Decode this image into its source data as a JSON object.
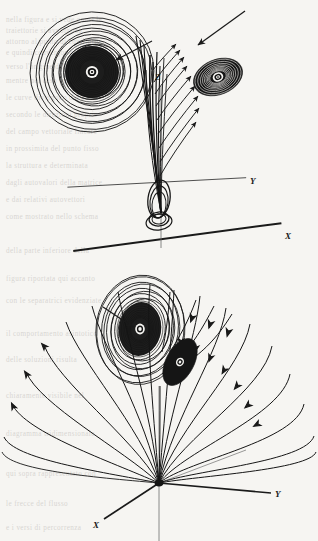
{
  "figure": {
    "background_color": "#f6f5f2",
    "ink_color": "#1a1a1a",
    "panels": [
      {
        "id": "upper-panel",
        "name": "upper-phase-portrait",
        "description": "Spiral focus trajectory winding down a vertical Z axis onto the origin of an X-Y plane",
        "origin": {
          "x": 161,
          "y": 213
        },
        "axes": [
          {
            "name": "x-axis",
            "label": "X",
            "label_x": 285,
            "label_y": 239,
            "stroke_width": 1.9
          },
          {
            "name": "y-axis",
            "label": "Y",
            "label_x": 250,
            "label_y": 184,
            "stroke_width": 0.75
          },
          {
            "name": "z-axis",
            "label": "Z",
            "label_x": 158,
            "label_y": 78,
            "stroke_width": 0.75
          }
        ],
        "features": [
          {
            "name": "large-spiral-focus",
            "center_x": 92,
            "center_y": 72,
            "radius_x": 62,
            "radius_y": 60,
            "turns": 17
          },
          {
            "name": "small-spiral-focus",
            "center_x": 218,
            "center_y": 77,
            "radius_x": 26,
            "radius_y": 18,
            "rotation_deg": -22,
            "turns": 12
          },
          {
            "name": "incoming-arrow",
            "from_x": 243,
            "from_y": 12,
            "to_x": 196,
            "to_y": 46
          },
          {
            "name": "trajectory-bundle",
            "count": 9
          }
        ]
      },
      {
        "id": "lower-panel",
        "name": "lower-phase-portrait",
        "description": "Fan of trajectories emanating from the origin node, feeding a spiral focus above the X-Y plane",
        "origin": {
          "x": 159,
          "y": 483
        },
        "axes": [
          {
            "name": "x-axis",
            "label": "X",
            "label_x": 97,
            "label_y": 525,
            "stroke_width": 1.6
          },
          {
            "name": "y-axis",
            "label": "Y",
            "label_x": 277,
            "label_y": 495,
            "stroke_width": 1.6
          },
          {
            "name": "z-axis",
            "label": "",
            "label_x": 0,
            "label_y": 0,
            "stroke_width": 0.7
          }
        ],
        "features": [
          {
            "name": "large-spiral-focus",
            "center_x": 140,
            "center_y": 329,
            "radius_x": 44,
            "radius_y": 54,
            "turns": 16
          },
          {
            "name": "small-spiral-focus",
            "center_x": 180,
            "center_y": 362,
            "radius_x": 14,
            "radius_y": 26,
            "rotation_deg": 28,
            "turns": 10
          },
          {
            "name": "trajectory-fan-left",
            "count": 8
          },
          {
            "name": "trajectory-fan-right",
            "count": 8
          }
        ]
      }
    ],
    "ghost_text": [
      {
        "text": "nella figura  e  si  vede  come  le",
        "x": 6,
        "y": 16
      },
      {
        "text": "traiettorie  si  avvolgono",
        "x": 6,
        "y": 27
      },
      {
        "text": "attorno  al  punto  di  equilibrio",
        "x": 6,
        "y": 38
      },
      {
        "text": "e  quindi  convergono",
        "x": 6,
        "y": 49
      },
      {
        "text": "verso  l'origine  del  sistema",
        "x": 6,
        "y": 63
      },
      {
        "text": "mentre  nel  caso  opposto",
        "x": 6,
        "y": 77
      },
      {
        "text": "le  curve  divergono  dal  nodo",
        "x": 6,
        "y": 94
      },
      {
        "text": "secondo  le  direzioni  proprie",
        "x": 6,
        "y": 111
      },
      {
        "text": "del  campo  vettoriale  lineare",
        "x": 6,
        "y": 128
      },
      {
        "text": "in  prossimita  del  punto  fisso",
        "x": 6,
        "y": 145
      },
      {
        "text": "la  struttura  e  determinata",
        "x": 6,
        "y": 162
      },
      {
        "text": "dagli  autovalori  della  matrice",
        "x": 6,
        "y": 179
      },
      {
        "text": "e  dai  relativi  autovettori",
        "x": 6,
        "y": 196
      },
      {
        "text": "come  mostrato  nello  schema",
        "x": 6,
        "y": 213
      },
      {
        "text": "della  parte  inferiore  della",
        "x": 6,
        "y": 247
      },
      {
        "text": "figura  riportata  qui  accanto",
        "x": 6,
        "y": 275
      },
      {
        "text": "con  le  separatrici  evidenziate",
        "x": 6,
        "y": 297
      },
      {
        "text": "il  comportamento  asintotico",
        "x": 6,
        "y": 330
      },
      {
        "text": "delle  soluzioni  risulta",
        "x": 6,
        "y": 356
      },
      {
        "text": "chiaramente  visibile  nel",
        "x": 6,
        "y": 392
      },
      {
        "text": "diagramma  tridimensionale",
        "x": 6,
        "y": 430
      },
      {
        "text": "qui  sopra  rappresentato  con",
        "x": 6,
        "y": 470
      },
      {
        "text": "le  frecce  del  flusso",
        "x": 6,
        "y": 500
      },
      {
        "text": "e  i  versi  di  percorrenza",
        "x": 6,
        "y": 524
      }
    ]
  }
}
